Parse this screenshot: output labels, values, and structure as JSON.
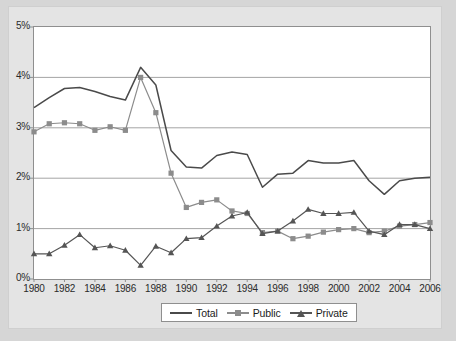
{
  "chart_data": {
    "type": "line",
    "title": "",
    "subtitle": "",
    "xlabel": "",
    "ylabel": "",
    "grid": true,
    "legend_position": "bottom",
    "xlim": [
      1980,
      2006
    ],
    "ylim": [
      0,
      5
    ],
    "ytick_labels": [
      "5%",
      "4%",
      "3%",
      "2%",
      "1%",
      "0%"
    ],
    "ytick_values": [
      5,
      4,
      3,
      2,
      1,
      0
    ],
    "xtick_labels": [
      "1980",
      "1982",
      "1984",
      "1986",
      "1988",
      "1990",
      "1992",
      "1994",
      "1996",
      "1998",
      "2000",
      "2002",
      "2004",
      "2006"
    ],
    "xtick_values": [
      1980,
      1982,
      1984,
      1986,
      1988,
      1990,
      1992,
      1994,
      1996,
      1998,
      2000,
      2002,
      2004,
      2006
    ],
    "x": [
      1980,
      1981,
      1982,
      1983,
      1984,
      1985,
      1986,
      1987,
      1988,
      1989,
      1990,
      1991,
      1992,
      1993,
      1994,
      1995,
      1996,
      1997,
      1998,
      1999,
      2000,
      2001,
      2002,
      2003,
      2004,
      2005,
      2006
    ],
    "series": [
      {
        "name": "Total",
        "color": "#4a4a4a",
        "marker": "none",
        "values": [
          3.4,
          3.6,
          3.78,
          3.8,
          3.72,
          3.62,
          3.55,
          4.2,
          3.85,
          2.55,
          2.22,
          2.2,
          2.45,
          2.52,
          2.47,
          1.82,
          2.08,
          2.1,
          2.35,
          2.3,
          2.3,
          2.35,
          1.95,
          1.68,
          1.95,
          2.0,
          2.02
        ]
      },
      {
        "name": "Public",
        "color": "#8c8c8c",
        "marker": "square",
        "values": [
          2.92,
          3.08,
          3.1,
          3.08,
          2.95,
          3.02,
          2.95,
          4.0,
          3.3,
          2.1,
          1.42,
          1.52,
          1.57,
          1.35,
          1.3,
          0.92,
          0.95,
          0.8,
          0.85,
          0.93,
          0.98,
          1.0,
          0.92,
          0.95,
          1.05,
          1.08,
          1.12
        ]
      },
      {
        "name": "Private",
        "color": "#555555",
        "marker": "triangle",
        "values": [
          0.5,
          0.5,
          0.67,
          0.88,
          0.62,
          0.66,
          0.57,
          0.27,
          0.65,
          0.52,
          0.8,
          0.82,
          1.05,
          1.25,
          1.32,
          0.9,
          0.95,
          1.15,
          1.38,
          1.3,
          1.3,
          1.32,
          0.95,
          0.88,
          1.08,
          1.08,
          1.0
        ]
      }
    ]
  },
  "legend": {
    "items": [
      {
        "label": "Total",
        "marker": "line"
      },
      {
        "label": "Public",
        "marker": "square"
      },
      {
        "label": "Private",
        "marker": "triangle"
      }
    ]
  },
  "colors": {
    "background": "#d6d6d6",
    "frame": "#e4e4e4",
    "panel": "#ffffff",
    "axis": "#8f8f8f",
    "grid": "#9a9a9a",
    "total": "#4a4a4a",
    "public": "#8c8c8c",
    "private": "#555555"
  }
}
